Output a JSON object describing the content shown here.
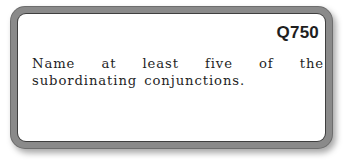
{
  "card": {
    "question_id": "Q750",
    "question_text": "Name at least five of the subordinating conjunctions.",
    "colors": {
      "border": "#6d6d6d",
      "face": "#ffffff",
      "text": "#1f1f1f"
    }
  }
}
